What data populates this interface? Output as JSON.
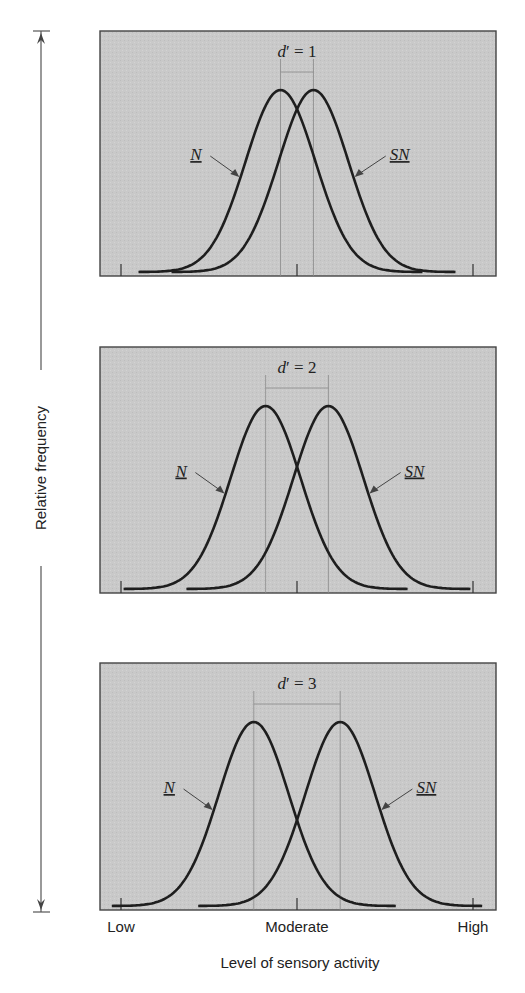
{
  "figure": {
    "y_axis_label": "Relative frequency",
    "x_axis_label": "Level of sensory activity",
    "x_tick_labels": [
      "Low",
      "Moderate",
      "High"
    ],
    "panel_background": "#c8c8c8",
    "curve_color": "#1e1e1e"
  },
  "chart_data": [
    {
      "type": "line",
      "title": "d' = 1",
      "d_prime": 1,
      "xlabel": "Level of sensory activity",
      "ylabel": "Relative frequency",
      "x_ticks": [
        "Low",
        "Moderate",
        "High"
      ],
      "series": [
        {
          "name": "N",
          "distribution": "normal",
          "mean": -0.5,
          "sd": 1
        },
        {
          "name": "SN",
          "distribution": "normal",
          "mean": 0.5,
          "sd": 1
        }
      ],
      "xlim": [
        -6,
        6
      ],
      "grid": false,
      "annotations": [
        "N",
        "SN",
        "d' = 1"
      ]
    },
    {
      "type": "line",
      "title": "d' = 2",
      "d_prime": 2,
      "xlabel": "Level of sensory activity",
      "ylabel": "Relative frequency",
      "x_ticks": [
        "Low",
        "Moderate",
        "High"
      ],
      "series": [
        {
          "name": "N",
          "distribution": "normal",
          "mean": -1,
          "sd": 1
        },
        {
          "name": "SN",
          "distribution": "normal",
          "mean": 1,
          "sd": 1
        }
      ],
      "xlim": [
        -6,
        6
      ],
      "grid": false,
      "annotations": [
        "N",
        "SN",
        "d' = 2"
      ]
    },
    {
      "type": "line",
      "title": "d' = 3",
      "d_prime": 3,
      "xlabel": "Level of sensory activity",
      "ylabel": "Relative frequency",
      "x_ticks": [
        "Low",
        "Moderate",
        "High"
      ],
      "series": [
        {
          "name": "N",
          "distribution": "normal",
          "mean": -1.5,
          "sd": 1
        },
        {
          "name": "SN",
          "distribution": "normal",
          "mean": 1.5,
          "sd": 1
        }
      ],
      "xlim": [
        -6,
        6
      ],
      "grid": false,
      "annotations": [
        "N",
        "SN",
        "d' = 3"
      ]
    }
  ],
  "panels": [
    {
      "label_prefix": "d",
      "label_suffix": "= 1",
      "n_label": "N",
      "sn_label": "SN"
    },
    {
      "label_prefix": "d",
      "label_suffix": "= 2",
      "n_label": "N",
      "sn_label": "SN"
    },
    {
      "label_prefix": "d",
      "label_suffix": "= 3",
      "n_label": "N",
      "sn_label": "SN"
    }
  ]
}
